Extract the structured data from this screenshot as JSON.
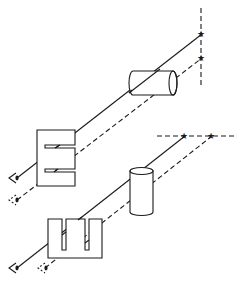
{
  "diagram": {
    "colors": {
      "line": "#1a1a1a",
      "background": "#ffffff"
    },
    "top_setup": {
      "reference_line": "vertical-dashed",
      "stars": 2,
      "cylinder_orientation": "horizontal",
      "plate_shape": "E-shaped (horizontal slots)",
      "eyes": 2
    },
    "bottom_setup": {
      "reference_line": "horizontal-dashed",
      "stars": 2,
      "cylinder_orientation": "vertical",
      "plate_shape": "comb-shaped (vertical slots)",
      "eyes": 2
    },
    "icons": {
      "star": "★",
      "eye": "eye-icon"
    }
  }
}
